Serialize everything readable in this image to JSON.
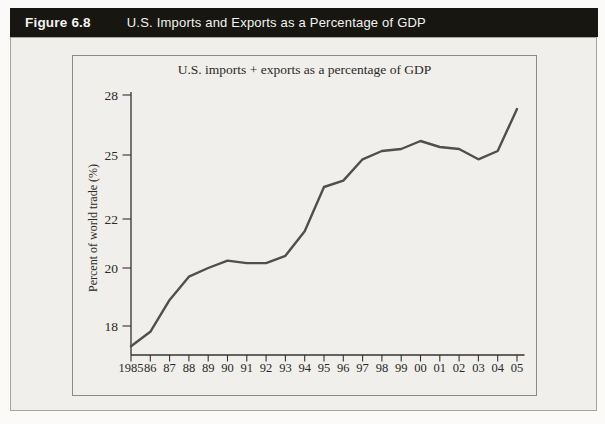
{
  "header": {
    "figure_label": "Figure 6.8",
    "title": "U.S. Imports and Exports as a Percentage of GDP",
    "bar_color": "#171611",
    "text_color": "#f4f3f1"
  },
  "chart_data": {
    "type": "line",
    "title": "U.S. imports + exports as a percentage of GDP",
    "xlabel": "",
    "ylabel": "Percent of world trade (%)",
    "categories": [
      "1985",
      "86",
      "87",
      "88",
      "89",
      "90",
      "91",
      "92",
      "93",
      "94",
      "95",
      "96",
      "97",
      "98",
      "99",
      "00",
      "01",
      "02",
      "03",
      "04",
      "05"
    ],
    "values": [
      17.3,
      17.8,
      18.9,
      19.7,
      20.0,
      20.3,
      20.2,
      20.2,
      20.5,
      21.5,
      23.5,
      23.8,
      24.8,
      25.2,
      25.3,
      25.7,
      25.4,
      25.3,
      24.8,
      25.2,
      27.3
    ],
    "y_ticks": [
      18,
      20,
      22,
      25,
      28
    ],
    "ylim": [
      17,
      28
    ],
    "grid": false,
    "legend": "none",
    "line_color": "#504f4b",
    "axis_color": "#34332f"
  }
}
